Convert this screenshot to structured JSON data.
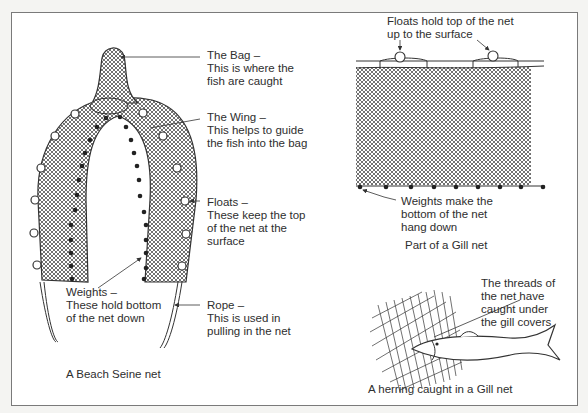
{
  "beach_seine": {
    "caption": "A Beach Seine net",
    "bag": {
      "title": "The Bag –",
      "line1": "This is where the",
      "line2": "fish are caught"
    },
    "wing": {
      "title": "The Wing –",
      "line1": "This helps to guide",
      "line2": "the fish into the bag"
    },
    "floats": {
      "title": "Floats –",
      "line1": "These keep the top",
      "line2": "of the net at the",
      "line3": "surface"
    },
    "weights": {
      "title": "Weights –",
      "line1": "These hold bottom",
      "line2": "of the net down"
    },
    "rope": {
      "title": "Rope –",
      "line1": "This is used in",
      "line2": "pulling in the net"
    }
  },
  "gill_net": {
    "caption": "Part of a Gill net",
    "floats": {
      "line1": "Floats hold top of the net",
      "line2": "up to the surface"
    },
    "weights": {
      "line1": "Weights make the",
      "line2": "bottom of the net",
      "line3": "hang down"
    }
  },
  "herring": {
    "caption": "A herring caught in a Gill net",
    "note": {
      "line1": "The threads of",
      "line2": "the net have",
      "line3": "caught under",
      "line4": "the gill covers"
    }
  },
  "colors": {
    "line": "#333333",
    "frame": "#7a7a7a",
    "background": "#ffffff"
  }
}
